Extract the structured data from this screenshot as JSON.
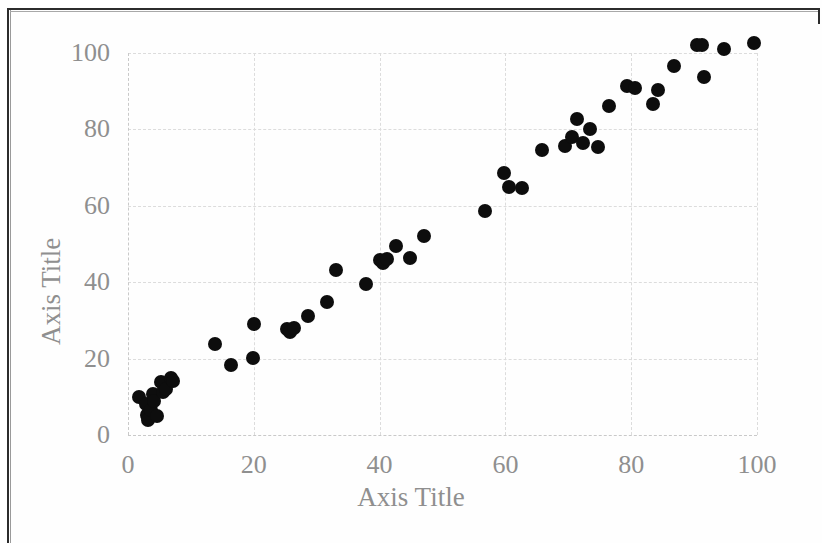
{
  "page": {
    "background_color": "#fefefe",
    "border_color": "#2b2b2b"
  },
  "chart_data": {
    "type": "scatter",
    "title": "",
    "xlabel": "Axis Title",
    "ylabel": "Axis Title",
    "xlim": [
      0,
      100
    ],
    "ylim": [
      0,
      100
    ],
    "x_ticks": [
      0,
      20,
      40,
      60,
      80,
      100
    ],
    "y_ticks": [
      0,
      20,
      40,
      60,
      80,
      100
    ],
    "grid": true,
    "grid_style": "dashed",
    "grid_color": "#dcdcdc",
    "legend": null,
    "marker": {
      "shape": "circle",
      "color": "#0d0d0d",
      "size_px": 14
    },
    "series": [
      {
        "name": "data",
        "points": [
          [
            1.8,
            10.0
          ],
          [
            2.8,
            8.2
          ],
          [
            3.0,
            5.2
          ],
          [
            3.2,
            3.8
          ],
          [
            3.6,
            6.5
          ],
          [
            4.0,
            10.8
          ],
          [
            4.2,
            8.8
          ],
          [
            4.6,
            5.0
          ],
          [
            5.2,
            13.8
          ],
          [
            5.6,
            11.2
          ],
          [
            6.0,
            12.0
          ],
          [
            6.8,
            14.8
          ],
          [
            7.2,
            14.2
          ],
          [
            13.8,
            23.8
          ],
          [
            16.4,
            18.2
          ],
          [
            19.8,
            20.2
          ],
          [
            20.0,
            29.0
          ],
          [
            25.2,
            27.8
          ],
          [
            25.8,
            27.0
          ],
          [
            26.4,
            28.0
          ],
          [
            28.6,
            31.2
          ],
          [
            31.6,
            34.8
          ],
          [
            33.0,
            43.2
          ],
          [
            37.8,
            39.4
          ],
          [
            40.0,
            45.8
          ],
          [
            40.6,
            45.0
          ],
          [
            41.2,
            46.0
          ],
          [
            42.6,
            49.4
          ],
          [
            44.8,
            46.4
          ],
          [
            47.0,
            52.2
          ],
          [
            56.8,
            58.6
          ],
          [
            59.8,
            68.6
          ],
          [
            60.6,
            64.8
          ],
          [
            62.6,
            64.6
          ],
          [
            65.8,
            74.6
          ],
          [
            69.4,
            75.6
          ],
          [
            70.6,
            78.0
          ],
          [
            71.4,
            82.6
          ],
          [
            72.4,
            76.4
          ],
          [
            73.4,
            80.0
          ],
          [
            74.8,
            75.4
          ],
          [
            76.4,
            86.0
          ],
          [
            79.4,
            91.4
          ],
          [
            80.6,
            90.8
          ],
          [
            83.4,
            86.6
          ],
          [
            84.2,
            90.4
          ],
          [
            86.8,
            96.6
          ],
          [
            90.4,
            102.0
          ],
          [
            91.2,
            102.0
          ],
          [
            91.6,
            93.8
          ],
          [
            94.8,
            101.0
          ],
          [
            99.6,
            102.6
          ]
        ]
      }
    ]
  }
}
